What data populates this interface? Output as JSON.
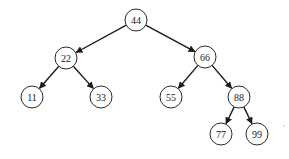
{
  "diagram": {
    "type": "binary-search-tree",
    "node_radius": 11,
    "colors": {
      "background": "#ffffff",
      "node_stroke": "#2a2a2a",
      "edge": "#1a1a1a",
      "text": "#222222"
    },
    "nodes": [
      {
        "id": "n44",
        "label": "44",
        "x": 136,
        "y": 20
      },
      {
        "id": "n22",
        "label": "22",
        "x": 66,
        "y": 58
      },
      {
        "id": "n66",
        "label": "66",
        "x": 205,
        "y": 57
      },
      {
        "id": "n11",
        "label": "11",
        "x": 32,
        "y": 97
      },
      {
        "id": "n33",
        "label": "33",
        "x": 101,
        "y": 97
      },
      {
        "id": "n55",
        "label": "55",
        "x": 171,
        "y": 97
      },
      {
        "id": "n88",
        "label": "88",
        "x": 239,
        "y": 97
      },
      {
        "id": "n77",
        "label": "77",
        "x": 221,
        "y": 134
      },
      {
        "id": "n99",
        "label": "99",
        "x": 257,
        "y": 134
      }
    ],
    "edges": [
      {
        "from": "n44",
        "to": "n22"
      },
      {
        "from": "n44",
        "to": "n66"
      },
      {
        "from": "n22",
        "to": "n11"
      },
      {
        "from": "n22",
        "to": "n33"
      },
      {
        "from": "n66",
        "to": "n55"
      },
      {
        "from": "n66",
        "to": "n88"
      },
      {
        "from": "n88",
        "to": "n77"
      },
      {
        "from": "n88",
        "to": "n99"
      }
    ]
  }
}
